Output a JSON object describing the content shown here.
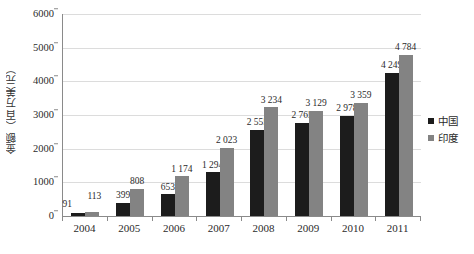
{
  "chart_data": {
    "type": "bar",
    "title": "",
    "xlabel": "",
    "ylabel": "金额（百万美元）",
    "ylim": [
      0,
      6000
    ],
    "ytick_labels": [
      "6000",
      "5000",
      "4000",
      "3000",
      "2000",
      "1000",
      "0"
    ],
    "ytick_values": [
      6000,
      5000,
      4000,
      3000,
      2000,
      1000,
      0
    ],
    "grid": true,
    "legend_position": "right",
    "categories": [
      "2004",
      "2005",
      "2006",
      "2007",
      "2008",
      "2009",
      "2010",
      "2011"
    ],
    "series": [
      {
        "name": "中国",
        "color": "#1c1c1c",
        "values": [
          91,
          399,
          653,
          1294,
          2555,
          2765,
          2978,
          4249
        ],
        "labels": [
          "91",
          "399",
          "653",
          "1 294",
          "2 555",
          "2 765",
          "2 978",
          "4 249"
        ]
      },
      {
        "name": "印度",
        "color": "#838383",
        "values": [
          113,
          808,
          1174,
          2023,
          3234,
          3129,
          3359,
          4784
        ],
        "labels": [
          "113",
          "808",
          "1 174",
          "2 023",
          "3 234",
          "3 129",
          "3 359",
          "4 784"
        ]
      }
    ]
  },
  "legend": {
    "items": [
      {
        "label": "中国",
        "color": "#1c1c1c"
      },
      {
        "label": "印度",
        "color": "#838383"
      }
    ]
  }
}
